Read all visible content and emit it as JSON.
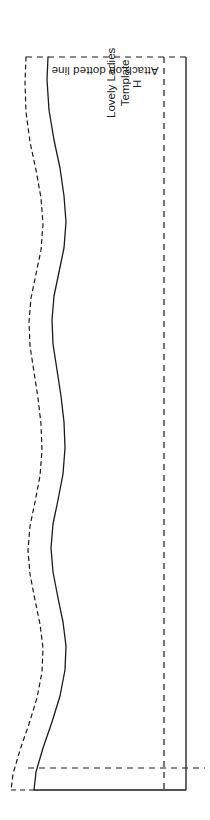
{
  "document": {
    "kind": "sewing-pattern-template",
    "orientation": "portrait",
    "background_color": "#ffffff",
    "ink_color": "#1a1a1a"
  },
  "labels": {
    "attach_note": "Attach on dotted line",
    "template_title_line1": "Lovely Ladies",
    "template_title_line2": "Template",
    "size_marker": "H"
  },
  "chart_data": {
    "type": "line",
    "title": "Lovely Ladies Template",
    "xlabel": "",
    "ylabel": "",
    "grid": false,
    "legend": null,
    "xlim": [
      0,
      210
    ],
    "ylim": [
      0,
      820
    ],
    "series": [
      {
        "name": "cutting-line-solid",
        "style": "solid",
        "color": "#1a1a1a",
        "width": 1.3,
        "points": [
          [
            48,
            57
          ],
          [
            47,
            80
          ],
          [
            49,
            110
          ],
          [
            54,
            140
          ],
          [
            60,
            168
          ],
          [
            64,
            196
          ],
          [
            66,
            222
          ],
          [
            64,
            248
          ],
          [
            59,
            272
          ],
          [
            54,
            296
          ],
          [
            52,
            320
          ],
          [
            53,
            344
          ],
          [
            57,
            370
          ],
          [
            61,
            396
          ],
          [
            64,
            422
          ],
          [
            65,
            448
          ],
          [
            63,
            474
          ],
          [
            58,
            500
          ],
          [
            53,
            524
          ],
          [
            51,
            548
          ],
          [
            53,
            572
          ],
          [
            58,
            598
          ],
          [
            63,
            622
          ],
          [
            66,
            646
          ],
          [
            65,
            670
          ],
          [
            60,
            696
          ],
          [
            52,
            722
          ],
          [
            43,
            748
          ],
          [
            36,
            772
          ],
          [
            34,
            790
          ]
        ]
      },
      {
        "name": "seam-allowance-dashed",
        "style": "dashed",
        "color": "#1a1a1a",
        "width": 1.2,
        "points": [
          [
            26,
            57
          ],
          [
            25,
            82
          ],
          [
            26,
            112
          ],
          [
            30,
            142
          ],
          [
            36,
            170
          ],
          [
            41,
            198
          ],
          [
            43,
            224
          ],
          [
            41,
            250
          ],
          [
            36,
            274
          ],
          [
            31,
            298
          ],
          [
            29,
            322
          ],
          [
            30,
            346
          ],
          [
            34,
            372
          ],
          [
            38,
            398
          ],
          [
            41,
            424
          ],
          [
            42,
            450
          ],
          [
            40,
            476
          ],
          [
            35,
            502
          ],
          [
            30,
            526
          ],
          [
            28,
            550
          ],
          [
            30,
            574
          ],
          [
            35,
            600
          ],
          [
            40,
            624
          ],
          [
            43,
            648
          ],
          [
            42,
            672
          ],
          [
            37,
            698
          ],
          [
            29,
            724
          ],
          [
            20,
            750
          ],
          [
            13,
            774
          ],
          [
            11,
            790
          ]
        ]
      }
    ],
    "guides": [
      {
        "name": "top-dashed-guide",
        "style": "dashed",
        "orientation": "horizontal",
        "x1": 26,
        "y1": 57,
        "x2": 190,
        "y2": 57
      },
      {
        "name": "bottom-dashed-guide",
        "style": "dashed",
        "orientation": "horizontal",
        "x1": 28,
        "y1": 768,
        "x2": 205,
        "y2": 768
      },
      {
        "name": "right-dashed-fold",
        "style": "dashed",
        "orientation": "vertical",
        "x1": 164,
        "y1": 57,
        "x2": 164,
        "y2": 790
      },
      {
        "name": "right-solid-edge",
        "style": "solid",
        "orientation": "vertical",
        "x1": 186,
        "y1": 57,
        "x2": 186,
        "y2": 790
      },
      {
        "name": "bottom-solid-edge",
        "style": "solid",
        "orientation": "horizontal",
        "x1": 34,
        "y1": 790,
        "x2": 186,
        "y2": 790
      },
      {
        "name": "bottom-left-dash-tip",
        "style": "dashed",
        "orientation": "horizontal",
        "x1": 11,
        "y1": 790,
        "x2": 34,
        "y2": 790
      }
    ]
  }
}
